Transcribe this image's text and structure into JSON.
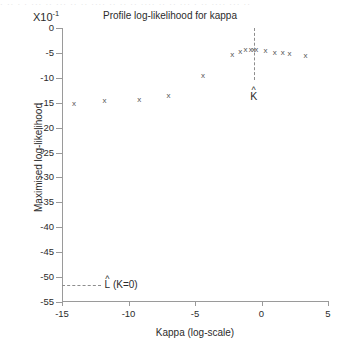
{
  "figure": {
    "scan_artifact_text": "· ·· · · ··· ·· ··· ·· ·· ···· ·· ·· ·· ···· ·· ·· ··· · ·· ···· ··· ··",
    "axis_multiplier_prefix": "X10",
    "axis_multiplier_exponent": "-1"
  },
  "chart_data": {
    "type": "scatter",
    "title": "Profile log-likelihood for kappa",
    "xlabel": "Kappa (log-scale)",
    "ylabel": "Maximised log-likelihood",
    "y_axis_multiplier": "X10-1",
    "xlim": [
      -15,
      5
    ],
    "ylim": [
      -55,
      0
    ],
    "xticks": [
      -15,
      -10,
      -5,
      0,
      5
    ],
    "xtick_labels": [
      "-15",
      "-10",
      "-5",
      "0",
      "5"
    ],
    "yticks": [
      0,
      -5,
      -10,
      -15,
      -20,
      -25,
      -30,
      -35,
      -40,
      -45,
      -50,
      -55
    ],
    "ytick_labels": [
      "0",
      "-5",
      "-10",
      "-15",
      "-20",
      "-25",
      "-30",
      "-35",
      "-40",
      "-45",
      "-50",
      "-55"
    ],
    "grid": false,
    "legend": "none",
    "marker": "x",
    "x": [
      -14.1,
      -11.8,
      -9.2,
      -7.0,
      -4.4,
      -2.2,
      -1.6,
      -1.2,
      -0.8,
      -0.6,
      -0.4,
      0.3,
      1.0,
      1.6,
      2.1,
      3.3
    ],
    "y": [
      -15.1,
      -14.6,
      -14.4,
      -13.5,
      -9.6,
      -5.3,
      -4.7,
      -4.4,
      -4.3,
      -4.3,
      -4.4,
      -4.6,
      -4.9,
      -5.0,
      -5.1,
      -5.6
    ],
    "annotations": [
      {
        "name": "kappa-hat",
        "label": "K",
        "accent": "^",
        "type": "vertical-dashed-line",
        "x": -0.55,
        "y_top": 0,
        "y_bottom": -10.5,
        "label_y": -12.5
      },
      {
        "name": "l-hat-k0",
        "label": "L (K=0)",
        "accent": "^",
        "type": "horizontal-dashed-line",
        "y": -51.6,
        "x_left": -15,
        "x_right": -12.1,
        "label_x": -11.8
      }
    ]
  }
}
